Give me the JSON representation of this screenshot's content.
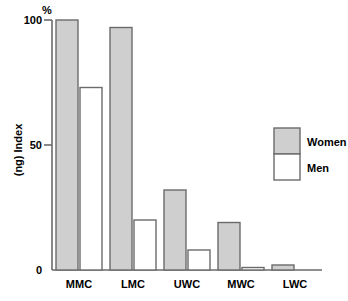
{
  "chart_data": {
    "type": "bar",
    "title": "",
    "xlabel": "",
    "ylabel": "(ng) Index",
    "unit_label": "%",
    "categories": [
      "MMC",
      "LMC",
      "UWC",
      "MWC",
      "LWC"
    ],
    "series": [
      {
        "name": "Women",
        "color": "#cfcfcf",
        "values": [
          100,
          97,
          32,
          19,
          2
        ]
      },
      {
        "name": "Men",
        "color": "#ffffff",
        "values": [
          73,
          20,
          8,
          1,
          0
        ]
      }
    ],
    "ylim": [
      0,
      100
    ],
    "ytick_labels": [
      "0",
      "50",
      "100"
    ],
    "ytick_values": [
      0,
      50,
      100
    ],
    "grid": false,
    "legend_position": "right"
  },
  "legend": {
    "entries": [
      {
        "label": "Women",
        "color": "#cfcfcf"
      },
      {
        "label": "Men",
        "color": "#ffffff"
      }
    ]
  },
  "axes": {
    "y_unit": "%",
    "y_title": "(ng) Index",
    "y_ticks": [
      {
        "label": "100",
        "value": 100
      },
      {
        "label": "50",
        "value": 50
      },
      {
        "label": "0",
        "value": 0
      }
    ],
    "x_ticks": [
      {
        "label": "MMC"
      },
      {
        "label": "LMC"
      },
      {
        "label": "UWC"
      },
      {
        "label": "MWC"
      },
      {
        "label": "LWC"
      }
    ]
  }
}
